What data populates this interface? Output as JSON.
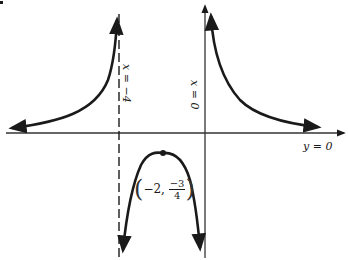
{
  "diagram": {
    "type": "rational function graph",
    "colors": {
      "ink": "#1a1a1a",
      "axis": "#333333",
      "background": "#ffffff"
    },
    "asymptotes": {
      "vertical_dashed": {
        "label": "x = −4"
      },
      "vertical_axis": {
        "label": "x = 0"
      },
      "horizontal_axis": {
        "label": "y = 0"
      }
    },
    "point": {
      "label_open": "(",
      "label_x": "−2,",
      "label_num": "−3",
      "label_den": "4",
      "label_close": ")"
    }
  }
}
